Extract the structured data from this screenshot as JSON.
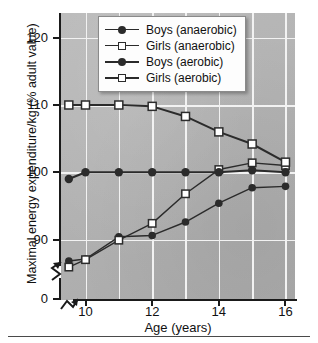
{
  "chart_data": {
    "type": "line",
    "title": "",
    "xlabel": "Age (years)",
    "ylabel": "Maximal energy expenditure/kg (% adult value)",
    "xlim": [
      9.4,
      16.4
    ],
    "ylim": [
      85,
      122
    ],
    "y_axis_break": true,
    "y_tick_labels": [
      "0",
      "90",
      "100",
      "110",
      "120"
    ],
    "x_tick_labels": [
      "10",
      "12",
      "14",
      "16"
    ],
    "x": [
      9.5,
      10,
      11,
      12,
      13,
      14,
      15,
      16
    ],
    "grid": "both",
    "legend_position": "top-center",
    "series": [
      {
        "name": "Boys (anaerobic)",
        "marker": "filled-circle",
        "line": "thin",
        "values": [
          86.8,
          87.1,
          90.4,
          90.6,
          92.6,
          95.4,
          97.7,
          97.9
        ]
      },
      {
        "name": "Girls (anaerobic)",
        "marker": "open-square",
        "line": "thin",
        "values": [
          85.9,
          87.0,
          89.9,
          92.4,
          96.8,
          100.4,
          101.4,
          101.0
        ]
      },
      {
        "name": "Boys (aerobic)",
        "marker": "filled-circle",
        "line": "thick",
        "values": [
          99.0,
          100.0,
          100.0,
          100.0,
          100.0,
          100.0,
          100.3,
          100.0
        ]
      },
      {
        "name": "Girls (aerobic)",
        "marker": "open-square",
        "line": "thick",
        "values": [
          110.0,
          110.0,
          110.0,
          109.8,
          108.3,
          106.0,
          104.2,
          101.5
        ]
      }
    ]
  },
  "axis": {
    "y_title": "Maximal energy expenditure/kg (% adult value)",
    "x_title": "Age (years)",
    "y_ticks": [
      {
        "label": "120",
        "value": 120
      },
      {
        "label": "110",
        "value": 110
      },
      {
        "label": "100",
        "value": 100
      },
      {
        "label": "90",
        "value": 90
      },
      {
        "label": "0",
        "value": 0
      }
    ],
    "x_ticks": [
      {
        "label": "10",
        "value": 10
      },
      {
        "label": "12",
        "value": 12
      },
      {
        "label": "14",
        "value": 14
      },
      {
        "label": "16",
        "value": 16
      }
    ]
  },
  "legend": {
    "items": [
      {
        "label": "Boys (anaerobic)",
        "marker": "filled-circle",
        "line": "thin"
      },
      {
        "label": "Girls (anaerobic)",
        "marker": "open-square",
        "line": "thin"
      },
      {
        "label": "Boys (aerobic)",
        "marker": "filled-circle",
        "line": "thick"
      },
      {
        "label": "Girls (aerobic)",
        "marker": "open-square",
        "line": "thick"
      }
    ]
  },
  "colors": {
    "plot_background": "#b4b4b4",
    "gridline": "#f2f2f2",
    "axis": "#1a1a1a",
    "series_line": "#2b2b2b",
    "legend_background": "#fdfdfd",
    "page_background": "#ffffff"
  }
}
